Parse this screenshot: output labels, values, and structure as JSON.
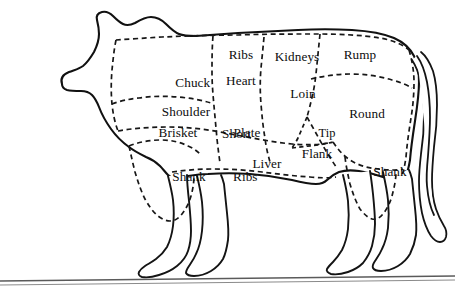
{
  "diagram": {
    "style": "line drawing with dashed cut boundaries",
    "background_color": "#ffffff",
    "line_color": "#111111",
    "cut_line_color": "#171717",
    "text_color": "#0d0d0d"
  },
  "labels": {
    "chuck_shoulder": {
      "line1": "Chuck",
      "line2": "Shoulder"
    },
    "ribs": "Ribs",
    "heart": "Heart",
    "short_ribs": {
      "line1": "Short",
      "line2": "Ribs"
    },
    "kidneys": "Kidneys",
    "rump": "Rump",
    "loin": "Loin",
    "round": "Round",
    "tip": "Tip",
    "brisket": "Brisket",
    "plate": "Plate",
    "liver": "Liver",
    "flank": "Flank",
    "shank_front": "Shank",
    "shank_rear": "Shank"
  },
  "cut_regions": [
    {
      "name": "chuck-shoulder",
      "label": "Chuck Shoulder",
      "position": "forequarter-upper"
    },
    {
      "name": "ribs",
      "label": "Ribs",
      "position": "upper-mid-front"
    },
    {
      "name": "heart",
      "label": "Heart",
      "position": "mid-front"
    },
    {
      "name": "short-ribs",
      "label": "Short Ribs",
      "position": "mid-front-lower"
    },
    {
      "name": "kidneys",
      "label": "Kidneys",
      "position": "upper-mid-rear"
    },
    {
      "name": "rump",
      "label": "Rump",
      "position": "hindquarter-upper"
    },
    {
      "name": "loin",
      "label": "Loin",
      "position": "mid-rear"
    },
    {
      "name": "round",
      "label": "Round",
      "position": "hindquarter-mid"
    },
    {
      "name": "tip",
      "label": "Tip",
      "position": "hindquarter-lower-front"
    },
    {
      "name": "brisket",
      "label": "Brisket",
      "position": "forequarter-lower"
    },
    {
      "name": "plate",
      "label": "Plate",
      "position": "belly-front"
    },
    {
      "name": "liver",
      "label": "Liver",
      "position": "belly-mid"
    },
    {
      "name": "flank",
      "label": "Flank",
      "position": "belly-rear"
    },
    {
      "name": "shank-front",
      "label": "Shank",
      "position": "front-leg-upper"
    },
    {
      "name": "shank-rear",
      "label": "Shank",
      "position": "rear-leg-upper"
    }
  ]
}
